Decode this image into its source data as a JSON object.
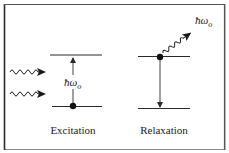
{
  "diagram": {
    "type": "energy-level-diagram",
    "panels": [
      {
        "id": "excitation",
        "label": "Excitation",
        "photon_label_main": "ħω",
        "photon_label_sub": "o",
        "incoming_photons": 2,
        "transition": "up"
      },
      {
        "id": "relaxation",
        "label": "Relaxation",
        "photon_label_main": "ħω",
        "photon_label_sub": "o",
        "emitted_photons": 1,
        "transition": "down"
      }
    ],
    "colors": {
      "line": "#2a2a2a",
      "border": "#3a3a3a",
      "background": "#ffffff"
    }
  }
}
